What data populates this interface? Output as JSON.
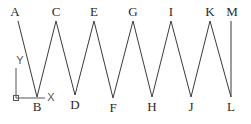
{
  "diagram": {
    "line_color": "#3a3a3a",
    "label_color": "#2a2a2a",
    "points": [
      {
        "id": "A",
        "x": 18,
        "y": 21,
        "lx": 15,
        "ly": 16
      },
      {
        "id": "B",
        "x": 37,
        "y": 97,
        "lx": 37,
        "ly": 111
      },
      {
        "id": "C",
        "x": 56,
        "y": 21,
        "lx": 56,
        "ly": 16
      },
      {
        "id": "D",
        "x": 75,
        "y": 95,
        "lx": 75,
        "ly": 109
      },
      {
        "id": "E",
        "x": 94,
        "y": 21,
        "lx": 94,
        "ly": 16
      },
      {
        "id": "F",
        "x": 113,
        "y": 98,
        "lx": 113,
        "ly": 112
      },
      {
        "id": "G",
        "x": 133,
        "y": 21,
        "lx": 133,
        "ly": 16
      },
      {
        "id": "H",
        "x": 152,
        "y": 97,
        "lx": 152,
        "ly": 111
      },
      {
        "id": "I",
        "x": 171,
        "y": 21,
        "lx": 171,
        "ly": 16
      },
      {
        "id": "J",
        "x": 191,
        "y": 97,
        "lx": 191,
        "ly": 111
      },
      {
        "id": "K",
        "x": 210,
        "y": 21,
        "lx": 210,
        "ly": 16
      },
      {
        "id": "L",
        "x": 231,
        "y": 97,
        "lx": 231,
        "ly": 111
      },
      {
        "id": "M",
        "x": 231,
        "y": 21,
        "lx": 232,
        "ly": 16
      }
    ],
    "ucs_icon": {
      "origin": {
        "x": 16,
        "y": 98
      },
      "x_axis_end": {
        "x": 45,
        "y": 98
      },
      "y_axis_end": {
        "x": 16,
        "y": 68
      },
      "x_label": "X",
      "y_label": "Y",
      "x_label_pos": {
        "x": 51,
        "y": 101
      },
      "y_label_pos": {
        "x": 20,
        "y": 64
      }
    }
  }
}
